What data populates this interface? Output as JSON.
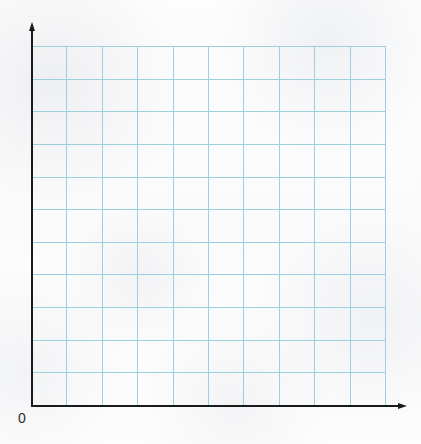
{
  "figure": {
    "kind": "blank-coordinate-grid",
    "background_color": "#fcfcfc"
  },
  "axes": {
    "origin_label": "0",
    "axis_color": "#1a1a1a",
    "x_axis": {
      "name": "x-axis",
      "label": "",
      "arrow": "arrow-right",
      "start_px": 31,
      "end_px": 400,
      "y_px": 405
    },
    "y_axis": {
      "name": "y-axis",
      "label": "",
      "arrow": "arrow-up",
      "start_px": 406,
      "end_px": 30,
      "x_px": 31
    }
  },
  "grid": {
    "color": "#9ccfe0",
    "columns": 10,
    "rows": 11,
    "left_px": 31,
    "top_px": 46,
    "right_px": 385,
    "bottom_px": 405,
    "cell_width_px": 35.4,
    "cell_height_px": 32.64,
    "x_tick_labels": [],
    "y_tick_labels": []
  },
  "chart_data": {
    "type": "scatter",
    "title": "",
    "subtitle": "",
    "xlabel": "",
    "ylabel": "",
    "x": [],
    "y": [],
    "series": [],
    "categories": [],
    "values": [],
    "annotations": [],
    "legend": [],
    "legend_position": "none",
    "grid": true,
    "xlim": [
      0,
      10
    ],
    "ylim": [
      0,
      11
    ],
    "xticks": [],
    "yticks": [],
    "note": "Blank grid — no data points, curves, labels or legend are drawn."
  }
}
